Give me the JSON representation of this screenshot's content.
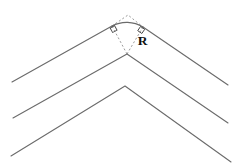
{
  "figure": {
    "label_R": "R",
    "colors": {
      "background": "#ffffff",
      "line": "#6b6b6b",
      "dotted": "#8f8f8f",
      "square": "#4a4a4a",
      "label": "#111111"
    },
    "geometry": {
      "canvas": {
        "width": 235,
        "height": 168
      },
      "outer_chevron": {
        "left_end": [
          12,
          82
        ],
        "left_tangent": [
          112,
          26
        ],
        "right_tangent": [
          143,
          27
        ],
        "right_end": [
          228,
          85
        ],
        "arc_radius": 31.5,
        "arc_center": [
          127,
          54
        ]
      },
      "dotted_apex": [
        128,
        15
      ],
      "middle_chevron": [
        [
          13,
          118
        ],
        [
          127,
          54
        ],
        [
          228,
          123
        ]
      ],
      "inner_chevron": [
        [
          11,
          156
        ],
        [
          125,
          86
        ],
        [
          231,
          162
        ]
      ],
      "squares": [
        {
          "cx": 113.6,
          "cy": 29.1,
          "size": 5,
          "angle": -29.2
        },
        {
          "cx": 141.2,
          "cy": 30.0,
          "size": 5,
          "angle": 34.3
        }
      ],
      "label_pos": [
        142.5,
        45
      ]
    }
  }
}
